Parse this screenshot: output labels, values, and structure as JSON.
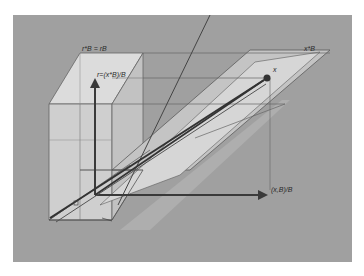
{
  "figure": {
    "type": "3d-geometric-diagram",
    "background_color": "#9a9a9a",
    "panel_color": "#a3a3a3",
    "box_face_color": "#d2d2d2",
    "plane_color": "#c9c9c9",
    "line_color": "#555555",
    "arrow_color": "#3a3a3a"
  },
  "labels": {
    "box_top": "r*B = rB",
    "vertical_axis": "r=(x*B)/B",
    "top_right": "x*B",
    "point": "x",
    "horizontal_axis": "(x,B)/B",
    "origin_marker": "s"
  }
}
